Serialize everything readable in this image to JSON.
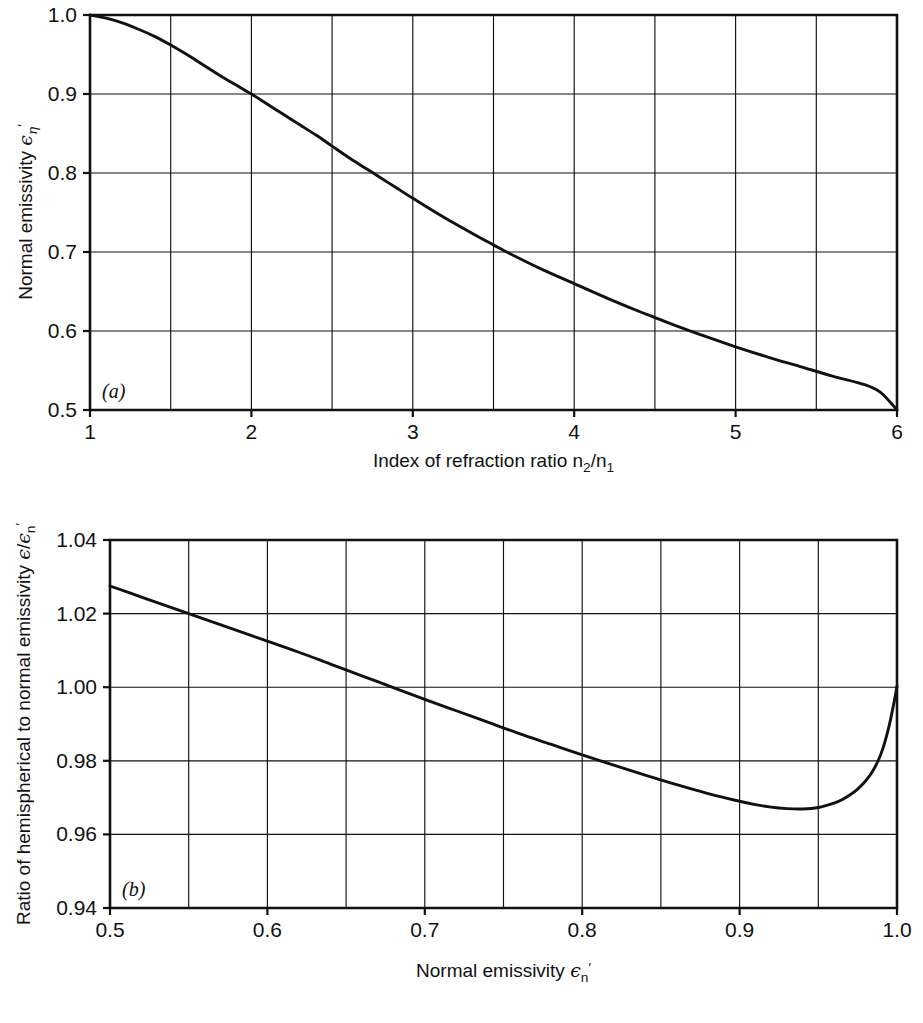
{
  "figure": {
    "background": "#ffffff",
    "ink_color": "#111111",
    "panel_count": 2
  },
  "chart_data": [
    {
      "id": "panel-a",
      "type": "line",
      "panel_label": "(a)",
      "title": "",
      "xlabel": "Index of refraction ratio n2/n1",
      "xlabel_parts": {
        "text": "Index of refraction ratio n",
        "sub1": "2",
        "slash": "/n",
        "sub2": "1"
      },
      "ylabel": "Normal emissivity ε'η",
      "ylabel_parts": {
        "text": "Normal emissivity ",
        "symbol": "ϵ",
        "sub": "η",
        "prime": "′"
      },
      "xlim": [
        1,
        6
      ],
      "ylim": [
        0.5,
        1.0
      ],
      "xticks": [
        1,
        2,
        3,
        4,
        5,
        6
      ],
      "xticklabels": [
        "1",
        "2",
        "3",
        "4",
        "5",
        "6"
      ],
      "yticks": [
        0.5,
        0.6,
        0.7,
        0.8,
        0.9,
        1.0
      ],
      "yticklabels": [
        "0.5",
        "0.6",
        "0.7",
        "0.8",
        "0.9",
        "1.0"
      ],
      "grid": true,
      "grid_x_step": 0.5,
      "grid_y_step": 0.1,
      "legend": "none",
      "x": [
        1.0,
        1.1,
        1.2,
        1.3,
        1.4,
        1.5,
        1.6,
        1.7,
        1.8,
        1.9,
        2.0,
        2.1,
        2.2,
        2.3,
        2.4,
        2.5,
        2.6,
        2.7,
        2.8,
        2.9,
        3.0,
        3.2,
        3.4,
        3.5,
        3.6,
        3.8,
        4.0,
        4.2,
        4.4,
        4.5,
        4.6,
        4.8,
        5.0,
        5.2,
        5.4,
        5.6,
        5.8,
        5.9,
        6.0
      ],
      "y": [
        1.0,
        0.996,
        0.99,
        0.982,
        0.973,
        0.962,
        0.95,
        0.937,
        0.924,
        0.912,
        0.9,
        0.887,
        0.874,
        0.861,
        0.848,
        0.834,
        0.82,
        0.807,
        0.794,
        0.781,
        0.768,
        0.743,
        0.72,
        0.709,
        0.698,
        0.678,
        0.66,
        0.642,
        0.625,
        0.617,
        0.609,
        0.594,
        0.58,
        0.567,
        0.555,
        0.543,
        0.532,
        0.522,
        0.5
      ]
    },
    {
      "id": "panel-b",
      "type": "line",
      "panel_label": "(b)",
      "title": "",
      "xlabel": "Normal emissivity ε'n",
      "xlabel_parts": {
        "text": "Normal emissivity ",
        "symbol": "ϵ",
        "sub": "n",
        "prime": "′"
      },
      "ylabel": "Ratio of hemispherical to normal emissivity ε/ε'n",
      "ylabel_parts": {
        "text": "Ratio of hemispherical to normal emissivity ",
        "symbol1": "ϵ",
        "slash": "/",
        "symbol2": "ϵ",
        "sub": "n",
        "prime": "′"
      },
      "xlim": [
        0.5,
        1.0
      ],
      "ylim": [
        0.94,
        1.04
      ],
      "xticks": [
        0.5,
        0.6,
        0.7,
        0.8,
        0.9,
        1.0
      ],
      "xticklabels": [
        "0.5",
        "0.6",
        "0.7",
        "0.8",
        "0.9",
        "1.0"
      ],
      "yticks": [
        0.94,
        0.96,
        0.98,
        1.0,
        1.02,
        1.04
      ],
      "yticklabels": [
        "0.94",
        "0.96",
        "0.98",
        "1.00",
        "1.02",
        "1.04"
      ],
      "grid": true,
      "grid_x_step": 0.05,
      "grid_y_step": 0.02,
      "legend": "none",
      "x": [
        0.5,
        0.52,
        0.54,
        0.56,
        0.58,
        0.6,
        0.62,
        0.64,
        0.66,
        0.68,
        0.7,
        0.72,
        0.74,
        0.76,
        0.78,
        0.8,
        0.82,
        0.84,
        0.86,
        0.88,
        0.9,
        0.91,
        0.92,
        0.93,
        0.94,
        0.95,
        0.96,
        0.965,
        0.97,
        0.975,
        0.98,
        0.984,
        0.988,
        0.991,
        0.994,
        0.996,
        0.998,
        0.999,
        1.0
      ],
      "y": [
        1.0275,
        1.0245,
        1.0215,
        1.0185,
        1.0155,
        1.0125,
        1.0095,
        1.0063,
        1.0031,
        0.9999,
        0.9967,
        0.9936,
        0.9905,
        0.9874,
        0.9845,
        0.9816,
        0.9788,
        0.9761,
        0.9735,
        0.9711,
        0.969,
        0.9681,
        0.9674,
        0.967,
        0.9669,
        0.9673,
        0.9685,
        0.9694,
        0.9707,
        0.9723,
        0.9745,
        0.9768,
        0.98,
        0.9833,
        0.9878,
        0.9914,
        0.9956,
        0.9979,
        1.0003
      ]
    }
  ]
}
